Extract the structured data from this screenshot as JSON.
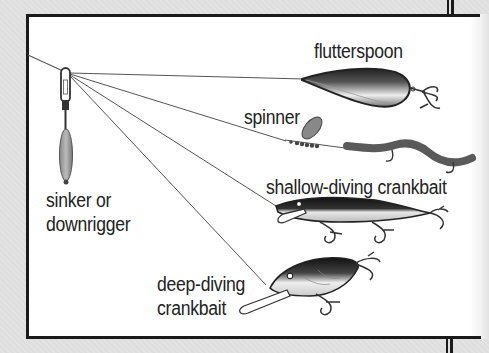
{
  "diagram": {
    "source_label": {
      "line1": "sinker or",
      "line2": "downrigger"
    },
    "lures": [
      {
        "id": "flutterspoon",
        "label": "flutterspoon"
      },
      {
        "id": "spinner",
        "label": "spinner"
      },
      {
        "id": "shallow-crankbait",
        "label": "shallow-diving crankbait"
      },
      {
        "id": "deep-crankbait",
        "label_line1": "deep-diving",
        "label_line2": "crankbait"
      }
    ],
    "colors": {
      "background": "#e2e2e2",
      "panel": "#ffffff",
      "border": "#1a1a1a",
      "line": "#555555",
      "text": "#222222",
      "worm": "#5a5a5a"
    }
  }
}
